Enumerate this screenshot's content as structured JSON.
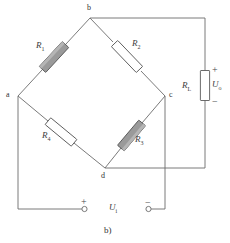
{
  "figure": {
    "caption": "b)",
    "type": "wheatstone-bridge-circuit"
  },
  "nodes": [
    {
      "id": "a",
      "label": "a",
      "x": 18,
      "y": 96
    },
    {
      "id": "b",
      "label": "b",
      "x": 90,
      "y": 18
    },
    {
      "id": "c",
      "label": "c",
      "x": 165,
      "y": 96
    },
    {
      "id": "d",
      "label": "d",
      "x": 105,
      "y": 168
    }
  ],
  "resistors": [
    {
      "id": "R1",
      "name": "R",
      "sub": "1",
      "fill": "shaded",
      "edge": "a-b"
    },
    {
      "id": "R2",
      "name": "R",
      "sub": "2",
      "fill": "open",
      "edge": "b-c"
    },
    {
      "id": "R3",
      "name": "R",
      "sub": "3",
      "fill": "shaded",
      "edge": "c-d"
    },
    {
      "id": "R4",
      "name": "R",
      "sub": "4",
      "fill": "open",
      "edge": "a-d"
    },
    {
      "id": "RL",
      "name": "R",
      "sub": "L",
      "fill": "open",
      "edge": "output-branch"
    }
  ],
  "output": {
    "voltage_name": "U",
    "voltage_sub": "o",
    "plus": "+",
    "minus": "−"
  },
  "input": {
    "voltage_name": "U",
    "voltage_sub": "i",
    "plus": "+",
    "minus": "−",
    "plus_terminal": "terminal-circle",
    "minus_terminal": "terminal-circle"
  },
  "colors": {
    "wire": "#6b6b6b",
    "resistor_outline": "#5a5a5a",
    "resistor_shaded_fill": "#9a9a9a",
    "resistor_open_fill": "#ffffff",
    "text": "#3c3c3c",
    "background": "#ffffff"
  }
}
